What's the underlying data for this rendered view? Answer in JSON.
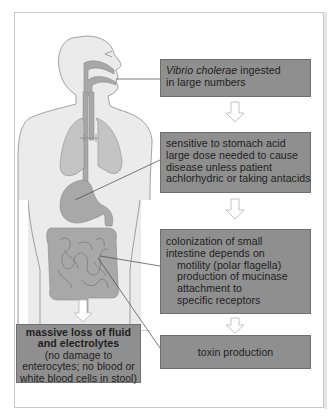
{
  "diagram": {
    "colors": {
      "box_fill": "#8f8f8f",
      "organ_fill": "#a8a8a8",
      "body_fill": "#ebebeb",
      "outline": "#8a8a8a",
      "arrow": "#b5b5b5"
    },
    "steps": [
      {
        "id": "ingestion",
        "italic_part": "Vibrio cholerae",
        "line1_rest": " ingested",
        "line2": "in large numbers"
      },
      {
        "id": "stomach",
        "lines": [
          "sensitive to stomach acid",
          "large dose needed to cause",
          "disease unless patient",
          "achlorhydric or taking antacids"
        ]
      },
      {
        "id": "colonization",
        "lines": [
          "colonization of small",
          "intestine depends on"
        ],
        "sub_lines": [
          "motility (polar flagella)",
          "production of mucinase",
          "attachment to",
          "specific receptors"
        ]
      },
      {
        "id": "toxin",
        "label": "toxin production"
      }
    ],
    "outcome": {
      "bold_lines": [
        "massive loss of fluid",
        "and electrolytes"
      ],
      "lines": [
        "(no damage to",
        "enterocytes; no blood or",
        "white blood cells in stool)"
      ]
    },
    "icons": {
      "flow_arrow": "down-arrow-outline",
      "body": "human-torso-digestive-tract"
    }
  }
}
